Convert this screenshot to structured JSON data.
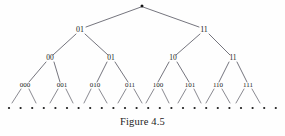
{
  "figure": {
    "caption": "Figure 4.5",
    "background_color": "#fefefe",
    "line_color": "#3a3a46",
    "text_color": "#1a1a1a"
  },
  "tree": {
    "root": {
      "label": "",
      "marker": "dot",
      "x": 142,
      "y": 6
    },
    "level1": [
      {
        "label": "01",
        "x": 80,
        "y": 30
      },
      {
        "label": "11",
        "x": 204,
        "y": 30
      }
    ],
    "level2": [
      {
        "label": "00",
        "x": 50,
        "y": 58
      },
      {
        "label": "01",
        "x": 111,
        "y": 58
      },
      {
        "label": "10",
        "x": 173,
        "y": 58
      },
      {
        "label": "11",
        "x": 233,
        "y": 58
      }
    ],
    "level3": [
      {
        "label": "000",
        "x": 25,
        "y": 85
      },
      {
        "label": "001",
        "x": 62,
        "y": 85
      },
      {
        "label": "010",
        "x": 95,
        "y": 85
      },
      {
        "label": "011",
        "x": 130,
        "y": 85
      },
      {
        "label": "100",
        "x": 158,
        "y": 85
      },
      {
        "label": "101",
        "x": 190,
        "y": 85
      },
      {
        "label": "110",
        "x": 218,
        "y": 85
      },
      {
        "label": "111",
        "x": 248,
        "y": 85
      }
    ],
    "leaf_dots": {
      "count": 24,
      "y": 108,
      "x_start": 9,
      "x_step": 11.6,
      "radius": 1.1
    }
  }
}
